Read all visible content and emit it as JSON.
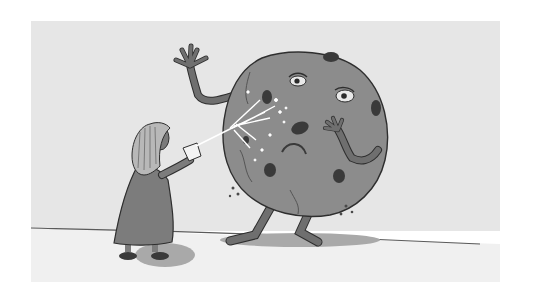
{
  "image": {
    "kind": "grayscale illustration",
    "scene": "A girl throws milk from a glass at a giant, sad chocolate-chip cookie creature with arms and legs",
    "width": 539,
    "height": 304
  },
  "colors": {
    "page_bg": "#ffffff",
    "wall": "#e6e6e6",
    "floor": "#efefef",
    "floor_line": "#5a5a5a",
    "cookie": "#8c8c8c",
    "cookie_dark": "#6a6a6a",
    "chip": "#3a3a3a",
    "limb": "#6f6f6f",
    "dress": "#7c7c7c",
    "hair": "#b8b8b8",
    "shadow": "#a9a9a9",
    "milk": "#ffffff",
    "outline": "#2e2e2e"
  },
  "elements": {
    "girl": "girl-with-glass",
    "cookie": "cookie-monster",
    "milk": "milk-splash"
  }
}
